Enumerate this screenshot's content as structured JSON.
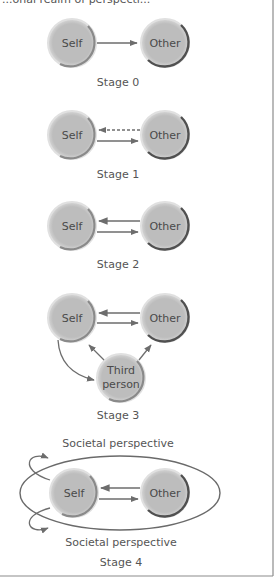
{
  "figure": {
    "top_caption_clipped": "...onal realm of perspecti...",
    "colors": {
      "node_fill": "#bfbfbf",
      "node_rim_light": "#e3e3e3",
      "other_arc": "#505050",
      "self_arc": "#8a8a8a",
      "arrow": "#6d6d6d",
      "border": "#8c8c8c"
    },
    "stages": [
      {
        "label": "Stage 0",
        "nodes": [
          "Self",
          "Other"
        ],
        "arrows": [
          {
            "from": "Self",
            "to": "Other",
            "style": "solid"
          }
        ]
      },
      {
        "label": "Stage 1",
        "nodes": [
          "Self",
          "Other"
        ],
        "arrows": [
          {
            "from": "Other",
            "to": "Self",
            "style": "dashed"
          },
          {
            "from": "Self",
            "to": "Other",
            "style": "solid"
          }
        ]
      },
      {
        "label": "Stage 2",
        "nodes": [
          "Self",
          "Other"
        ],
        "arrows": [
          {
            "from": "Other",
            "to": "Self",
            "style": "solid"
          },
          {
            "from": "Self",
            "to": "Other",
            "style": "solid"
          }
        ]
      },
      {
        "label": "Stage 3",
        "nodes": [
          "Self",
          "Other",
          "Third person"
        ],
        "third_line1": "Third",
        "third_line2": "person",
        "arrows": [
          {
            "from": "Other",
            "to": "Self",
            "style": "solid"
          },
          {
            "from": "Self",
            "to": "Other",
            "style": "solid"
          },
          {
            "from": "Third person",
            "to": "Self",
            "style": "solid"
          },
          {
            "from": "Third person",
            "to": "Other",
            "style": "solid"
          },
          {
            "from": "Self",
            "to": "Third person",
            "style": "curved"
          }
        ]
      },
      {
        "label": "Stage 4",
        "top_caption": "Societal perspective",
        "bottom_caption": "Societal perspective",
        "nodes": [
          "Self",
          "Other"
        ],
        "arrows": [
          {
            "from": "Other",
            "to": "Self",
            "style": "solid"
          },
          {
            "from": "Self",
            "to": "Other",
            "style": "solid"
          }
        ]
      }
    ],
    "node_labels": {
      "self": "Self",
      "other": "Other"
    }
  }
}
